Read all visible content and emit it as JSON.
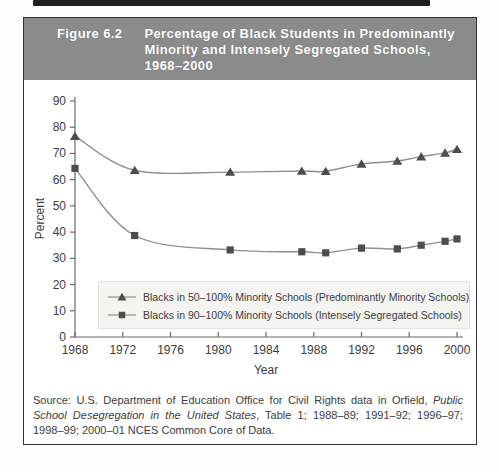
{
  "figure": {
    "label": "Figure 6.2",
    "title_lines": [
      "Percentage of Black Students in Predominantly",
      "Minority and Intensely Segregated Schools,",
      "1968–2000"
    ],
    "header_bg": "#8b8b8b",
    "header_text_color": "#ffffff"
  },
  "chart_data": {
    "type": "line",
    "title": "Percentage of Black Students in Predominantly Minority and Intensely Segregated Schools, 1968–2000",
    "xlabel": "Year",
    "ylabel": "Percent",
    "xlim": [
      1968,
      2000
    ],
    "ylim": [
      0,
      90
    ],
    "xticks": [
      1968,
      1972,
      1976,
      1980,
      1984,
      1988,
      1992,
      1996,
      2000
    ],
    "yticks": [
      0,
      10,
      20,
      30,
      40,
      50,
      60,
      70,
      80,
      90
    ],
    "grid": false,
    "legend_position": "inside-bottom",
    "school_years": [
      "1968–69",
      "1972–73",
      "1980–81",
      "1986–87",
      "1988–89",
      "1991–92",
      "1994–95",
      "1996–97",
      "1998–99",
      "2000–01"
    ],
    "x": [
      1968,
      1973,
      1981,
      1987,
      1989,
      1992,
      1995,
      1997,
      1999,
      2000
    ],
    "series": [
      {
        "name": "Blacks in 50–100% Minority Schools (Predominantly Minority Schools)",
        "marker": "triangle",
        "values": [
          76.6,
          63.6,
          62.9,
          63.3,
          63.2,
          66.0,
          67.1,
          68.8,
          70.2,
          71.6
        ]
      },
      {
        "name": "Blacks in 90–100% Minority Schools (Intensely Segregated Schools)",
        "marker": "square",
        "values": [
          64.3,
          38.7,
          33.2,
          32.5,
          32.1,
          33.9,
          33.6,
          35.0,
          36.5,
          37.4
        ]
      }
    ],
    "axis_color": "#6a6a6a",
    "line_color": "#8f8f8f",
    "marker_color": "#4d4d4d"
  },
  "source": {
    "prefix": "Source: U.S. Department of Education Office for Civil Rights data in Orfield, ",
    "italic": "Public School Desegregation in the United States",
    "suffix": ", Table 1; 1988–89; 1991–92; 1996–97; 1998–99; 2000–01 NCES Common Core of Data."
  }
}
